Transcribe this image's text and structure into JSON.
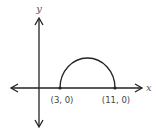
{
  "diagram": {
    "type": "coordinate-graph",
    "axes": {
      "x_label": "x",
      "y_label": "y"
    },
    "curve": {
      "shape": "semicircle-upper",
      "start_point": {
        "label": "(3, 0)",
        "x": 3,
        "y": 0
      },
      "end_point": {
        "label": "(11, 0)",
        "x": 11,
        "y": 0
      }
    },
    "colors": {
      "stroke": "#222222",
      "text": "#444444",
      "background": "#ffffff"
    }
  }
}
